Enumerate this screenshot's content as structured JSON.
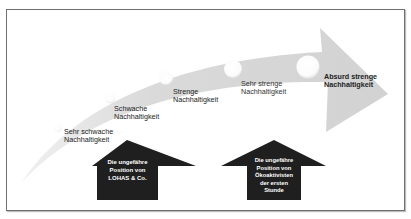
{
  "diagram": {
    "type": "sustainability-scale",
    "colors": {
      "swoosh": "#d6d6d6",
      "circle": "#ffffff",
      "up_arrow": "#1f1f1f",
      "frame": "#6f6f6f",
      "text": "#222222"
    },
    "stages": [
      {
        "line1": "Sehr schwache",
        "line2": "Nachhaltigkeit"
      },
      {
        "line1": "Schwache",
        "line2": "Nachhaltigkeit"
      },
      {
        "line1": "Strenge",
        "line2": "Nachhaltigkeit"
      },
      {
        "line1": "Sehr strenge",
        "line2": "Nachhaltigkeit"
      },
      {
        "line1": "Absurd strenge",
        "line2": "Nachhaltigkeit"
      }
    ],
    "markers": [
      {
        "lines": [
          "Die ungefähre",
          "Position von",
          "LOHAS & Co."
        ]
      },
      {
        "lines": [
          "Die ungefähre",
          "Position von",
          "Ökoaktivisten",
          "der ersten",
          "Stunde"
        ]
      }
    ]
  }
}
